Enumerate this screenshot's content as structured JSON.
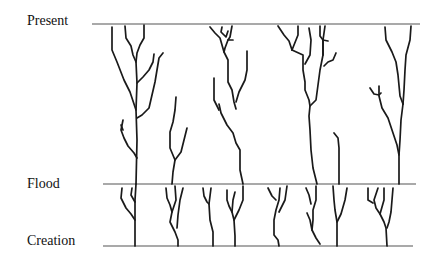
{
  "diagram": {
    "labels": {
      "present": "Present",
      "flood": "Flood",
      "creation": "Creation"
    },
    "timelines": [
      {
        "name": "present",
        "y": 24,
        "x1": 92,
        "x2": 420
      },
      {
        "name": "flood",
        "y": 184,
        "x1": 103,
        "x2": 416
      },
      {
        "name": "creation",
        "y": 246,
        "x1": 103,
        "x2": 413
      }
    ],
    "colors": {
      "line": "#555555",
      "branch": "#1a1a1a",
      "text": "#111111",
      "background": "#ffffff"
    },
    "branches": [
      "112,27 112,50 117,62 124,80 130,92 136,110",
      "125,26 126,38 131,46 133,55 136,62",
      "144,25 144,38 140,45 137,53 136,62 137,83 136,110 137,140 136,184",
      "154,54 153,62 149,70 143,77 137,83",
      "163,53 159,58 157,70 155,82 152,95 149,108 142,115 137,118",
      "123,120 121,130 124,138 128,146 134,153 137,158",
      "121,125 123,130",
      "176,97 175,110 173,122 170,132 170,148 175,160",
      "187,128 184,140 181,152 175,160 173,172 172,184",
      "210,27 215,33 220,38 224,52",
      "222,27 221,32 226,37 228,31",
      "232,26 230,37 228,40 233,40",
      "228,40 225,48 224,52 228,60 228,82 232,90 234,102 236,109",
      "247,51 247,70 245,80 239,92 236,102",
      "214,78 214,100 219,110",
      "219,104 221,113 227,125 233,133 236,143 240,150 240,170 243,184",
      "278,26 284,35 289,41 292,50",
      "298,26 298,35 292,50",
      "309,28 311,40 310,55 305,64",
      "320,26 320,36 323,40 328,41",
      "325,26 323,40 323,55",
      "336,53 333,60 328,62 324,66",
      "292,50 303,55 303,70 305,82 305,90 309,100 310,106",
      "323,40 323,55 320,70 318,85 316,100 310,106 309,116 310,130 311,150 313,168 316,180 317,184",
      "334,133 338,138 339,148 339,184",
      "385,27 386,40 392,52 396,62 398,75 400,96 403,104",
      "411,26 410,40 406,55 405,70 404,90 403,104",
      "370,88 374,94 379,95 381,93",
      "379,86 379,96 382,108 388,118 392,130 397,145 399,155",
      "403,104 401,120 400,140 399,155 399,184",
      "122,188 121,198 126,208 131,214 135,220",
      "132,188 131,195 135,202",
      "136,184 135,200 135,246",
      "166,188 167,198 170,205 172,212",
      "175,186 176,200 172,212 170,222 175,232 178,240 178,246",
      "183,188 180,200 178,215 177,228",
      "203,188 204,196 207,202 209,204",
      "211,188 209,204 210,220 213,232 213,246",
      "227,190 227,200 229,206 232,212 234,220 235,236 235,246",
      "235,192 233,200 232,212",
      "243,186 243,200 239,210 234,220",
      "268,188 272,196 276,200",
      "280,188 279,200 276,210 274,220 274,235 278,240 279,246",
      "287,186 285,200 279,212",
      "306,188 309,195 311,204",
      "316,186 316,200 313,210 313,220 312,230",
      "307,213 310,220 312,230 316,238 320,244",
      "333,186 334,200 335,210 337,222",
      "347,188 345,200 341,214 337,222 337,246",
      "368,188 368,200 373,203",
      "378,188 374,200 376,208 380,214",
      "384,188 384,200 380,214 384,222 386,228 387,246",
      "393,188 392,200 391,212 389,222 387,228"
    ]
  }
}
